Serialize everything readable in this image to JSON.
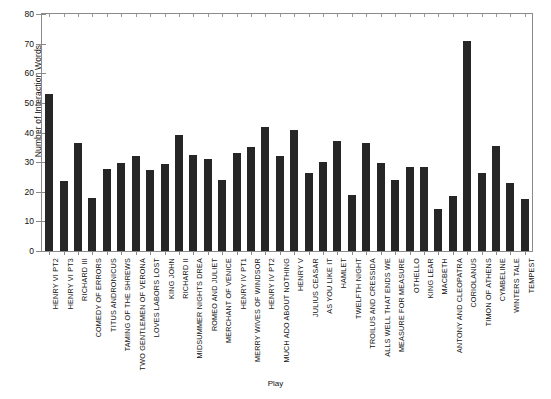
{
  "chart_data": {
    "type": "bar",
    "title": "",
    "xlabel": "Play",
    "ylabel": "Number of Interaction Words",
    "ylim": [
      0,
      80
    ],
    "yticks": [
      0,
      10,
      20,
      30,
      40,
      50,
      60,
      70,
      80
    ],
    "grid": false,
    "legend": null,
    "bar_color": "#262626",
    "axis_color": "#8a8a8a",
    "categories": [
      "HENRY VI PT2",
      "HENRY VI PT3",
      "RICHARD III",
      "COMEDY OF ERRORS",
      "TITUS ANDRONICUS",
      "TAMING OF THE SHREWS",
      "TWO GENTLEMEN OF VERONA",
      "LOVES LABORS LOST",
      "KING JOHN",
      "RICHARD II",
      "MIDSUMMER NIGHTS DREA",
      "ROMEO AND JULIET",
      "MERCHANT OF VENICE",
      "HENRY IV PT1",
      "MERRY WIVES OF WINDSOR",
      "HENRY IV PT2",
      "MUCH ADO ABOUT NOTHING",
      "HENRY V",
      "JULIUS CEASAR",
      "AS YOU LIKE IT",
      "HAMLET",
      "TWELFTH NIGHT",
      "TROILUS AND CRESSIDA",
      "ALLS WELL THAT ENDS WE",
      "MEASURE FOR MEASURE",
      "OTHELLO",
      "KING LEAR",
      "MACBETH",
      "ANTONY AND CLEOPATRA",
      "CORIOLANUS",
      "TIMON OF ATHENS",
      "CYMBELINE",
      "WINTERS TALE",
      "TEMPEST"
    ],
    "values": [
      53,
      23.7,
      36.6,
      17.8,
      27.6,
      29.8,
      32,
      27.5,
      29.3,
      39,
      32.5,
      31,
      24,
      33,
      35,
      42,
      32,
      41,
      26.5,
      29.9,
      37,
      19,
      36.4,
      29.6,
      24,
      28.4,
      28.5,
      14.2,
      18.5,
      71,
      26.5,
      35.5,
      23,
      17.5
    ]
  }
}
